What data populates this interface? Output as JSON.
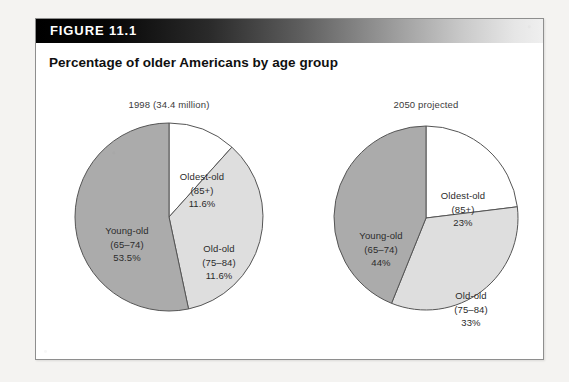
{
  "figure": {
    "label": "FIGURE 11.1",
    "title": "Percentage of older Americans by age group"
  },
  "colors": {
    "young_old": "#ABABAB",
    "old_old": "#DEDEDE",
    "oldest_old": "#FFFFFF",
    "outline": "#555555",
    "header_dark": "#000000",
    "header_light": "#F0F0F0",
    "page_background": "#F4F3F1",
    "box_background": "#FFFFFF"
  },
  "chart_data": {
    "type": "pie",
    "title": "Percentage of older Americans by age group",
    "legend_position": "none",
    "grid": false,
    "charts": [
      {
        "name": "1998",
        "caption": "1998 (34.4 million)",
        "categories": [
          "Oldest-old",
          "Old-old",
          "Young-old"
        ],
        "slices": [
          {
            "name": "Oldest-old",
            "age_range": "(85+)",
            "percent_label": "11.6%",
            "value": 11.6,
            "color": "#FFFFFF",
            "label_lines": [
              "Oldest-old",
              "(85+)",
              "11.6%"
            ]
          },
          {
            "name": "Old-old",
            "age_range": "(75–84)",
            "percent_label": "11.6%",
            "value": 11.6,
            "color": "#DEDEDE",
            "label_lines": [
              "Old-old",
              "(75–84)",
              "11.6%"
            ]
          },
          {
            "name": "Young-old",
            "age_range": "(65–74)",
            "percent_label": "53.5%",
            "value": 53.5,
            "color": "#ABABAB",
            "label_lines": [
              "Young-old",
              "(65–74)",
              "53.5%"
            ]
          }
        ]
      },
      {
        "name": "2050",
        "caption": "2050 projected",
        "categories": [
          "Oldest-old",
          "Old-old",
          "Young-old"
        ],
        "slices": [
          {
            "name": "Oldest-old",
            "age_range": "(85+)",
            "percent_label": "23%",
            "value": 23,
            "color": "#FFFFFF",
            "label_lines": [
              "Oldest-old",
              "(85+)",
              "23%"
            ]
          },
          {
            "name": "Old-old",
            "age_range": "(75–84)",
            "percent_label": "33%",
            "value": 33,
            "color": "#DEDEDE",
            "label_lines": [
              "Old-old",
              "(75–84)",
              "33%"
            ]
          },
          {
            "name": "Young-old",
            "age_range": "(65–74)",
            "percent_label": "44%",
            "value": 44,
            "color": "#ABABAB",
            "label_lines": [
              "Young-old",
              "(65–74)",
              "44%"
            ]
          }
        ]
      }
    ]
  }
}
